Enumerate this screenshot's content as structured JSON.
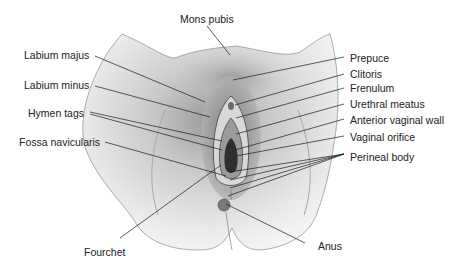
{
  "figure": {
    "type": "anatomical-illustration",
    "colors": {
      "background": "#ffffff",
      "line": "#1a1a1a",
      "text": "#222222",
      "skin_light": "#e6e6e6",
      "skin_mid": "#b5b5b5",
      "skin_dark": "#555555"
    }
  },
  "labels": {
    "mons_pubis": "Mons pubis",
    "labium_majus": "Labium majus",
    "labium_minus": "Labium minus",
    "hymen_tags": "Hymen tags",
    "fossa_navicularis": "Fossa navicularis",
    "fourchet": "Fourchet",
    "prepuce": "Prepuce",
    "clitoris": "Clitoris",
    "frenulum": "Frenulum",
    "urethral_meatus": "Urethral meatus",
    "anterior_vaginal_wall": "Anterior vaginal wall",
    "vaginal_orifice": "Vaginal orifice",
    "perineal_body": "Perineal body",
    "anus": "Anus"
  }
}
